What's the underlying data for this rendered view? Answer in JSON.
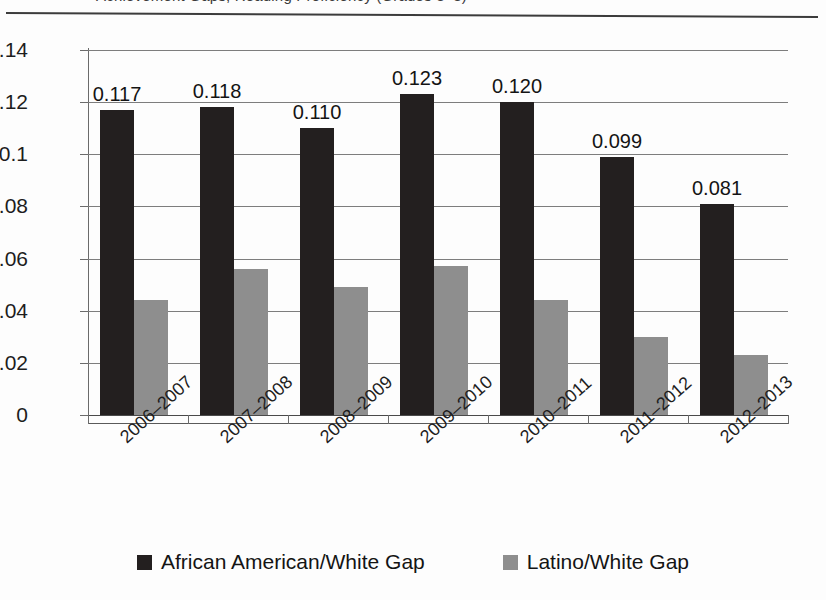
{
  "title": {
    "text": "Achievement Gaps, Reading Proficiency (Grades 3–8)",
    "clipped": true
  },
  "chart_data": {
    "type": "bar",
    "title": "",
    "xlabel": "",
    "ylabel": "",
    "ylim": [
      0,
      0.14
    ],
    "yticks": [
      "0",
      "0.02",
      "0.04",
      "0.06",
      "0.08",
      "0.1",
      "0.12",
      "0.14"
    ],
    "ytick_values": [
      0,
      0.02,
      0.04,
      0.06,
      0.08,
      0.1,
      0.12,
      0.14
    ],
    "grid": true,
    "legend_position": "bottom",
    "categories": [
      "2006–2007",
      "2007–2008",
      "2008–2009",
      "2009–2010",
      "2010–2011",
      "2011–2012",
      "2012–2013"
    ],
    "series": [
      {
        "name": "African American/White Gap",
        "color": "#231f1f",
        "values": [
          0.117,
          0.118,
          0.11,
          0.123,
          0.12,
          0.099,
          0.081
        ],
        "labels": [
          "0.117",
          "0.118",
          "0.110",
          "0.123",
          "0.120",
          "0.099",
          "0.081"
        ],
        "show_labels": true
      },
      {
        "name": "Latino/White Gap",
        "color": "#8e8e8e",
        "values": [
          0.044,
          0.056,
          0.049,
          0.057,
          0.044,
          0.03,
          0.023
        ],
        "labels": [
          "",
          "",
          "",
          "",
          "",
          "",
          ""
        ],
        "show_labels": false
      }
    ]
  },
  "legend": [
    {
      "label": "African American/White Gap",
      "color": "#231f1f",
      "marker": "square-swatch"
    },
    {
      "label": "Latino/White Gap",
      "color": "#8e8e8e",
      "marker": "square-swatch"
    }
  ]
}
